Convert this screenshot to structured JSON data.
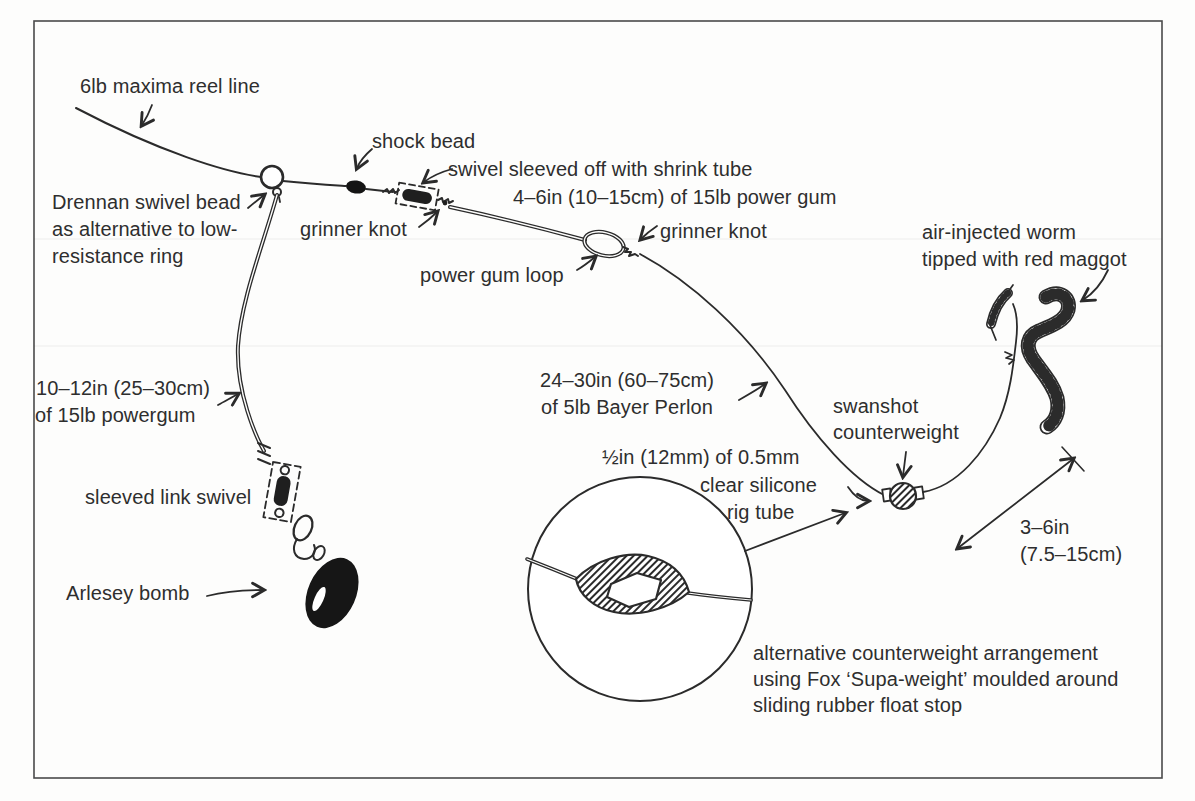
{
  "figure": {
    "title_context": "fishing rig diagram",
    "colors": {
      "ink": "#2b2b2b",
      "paper": "#fdfdfc"
    },
    "labels": {
      "reel_line": "6lb maxima reel line",
      "drennan_1": "Drennan swivel bead",
      "drennan_2": "as alternative to low-",
      "drennan_3": "resistance ring",
      "shock_bead": "shock bead",
      "swivel_sleeve_1": "swivel sleeved off with shrink tube",
      "swivel_sleeve_2": "4–6in (10–15cm) of 15lb power gum",
      "grinner_left": "grinner knot",
      "power_gum_loop": "power gum loop",
      "grinner_right": "grinner knot",
      "worm_1": "air-injected worm",
      "worm_2": "tipped with red maggot",
      "powergum_1": "10–12in (25–30cm)",
      "powergum_2": "of 15lb powergum",
      "bayer_1": "24–30in (60–75cm)",
      "bayer_2": "of 5lb Bayer Perlon",
      "swanshot_1": "swanshot",
      "swanshot_2": "counterweight",
      "silicone_1": "½in (12mm) of 0.5mm",
      "silicone_2": "clear silicone",
      "silicone_3": "rig tube",
      "sleeved_link": "sleeved link swivel",
      "arlesey": "Arlesey bomb",
      "distance_1": "3–6in",
      "distance_2": "(7.5–15cm)",
      "alt_counterweight_1": "alternative counterweight arrangement",
      "alt_counterweight_2": "using Fox ‘Supa-weight’ moulded around",
      "alt_counterweight_3": "sliding rubber float stop"
    }
  }
}
